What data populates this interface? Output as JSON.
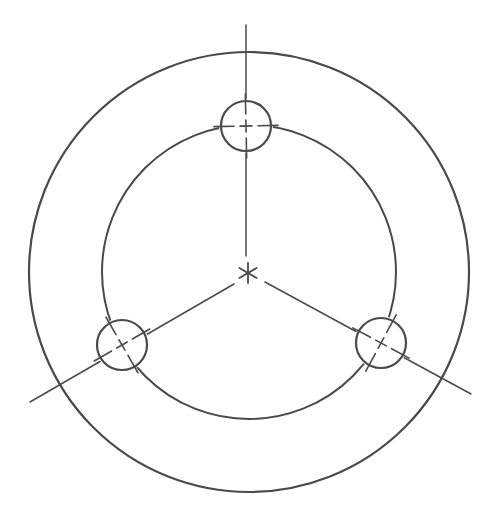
{
  "diagram": {
    "type": "bolt-circle-drawing",
    "stroke_color": "#4a4a4a",
    "background": "#ffffff",
    "center": {
      "x": 249,
      "y": 272
    },
    "outer_circle": {
      "cx": 249,
      "cy": 272,
      "r": 220
    },
    "pitch_circle": {
      "cx": 249,
      "cy": 272,
      "r": 147
    },
    "holes": [
      {
        "cx": 246,
        "cy": 126,
        "r": 25
      },
      {
        "cx": 122,
        "cy": 345,
        "r": 25
      },
      {
        "cx": 381,
        "cy": 343,
        "r": 25
      }
    ],
    "radial_lines": [
      {
        "x1": 246,
        "y1": 25,
        "x2": 246,
        "y2": 256
      },
      {
        "x1": 30,
        "y1": 402,
        "x2": 234,
        "y2": 284
      },
      {
        "x1": 471,
        "y1": 394,
        "x2": 265,
        "y2": 282
      }
    ],
    "center_mark": "asterisk"
  }
}
